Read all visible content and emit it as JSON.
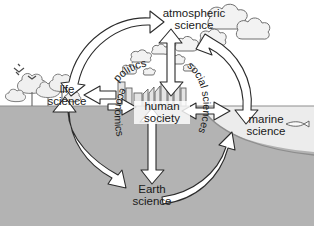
{
  "diagram": {
    "nodes": [
      {
        "id": "atmospheric",
        "label_line1": "atmospheric",
        "label_line2": "science",
        "name": "node-atmospheric-science"
      },
      {
        "id": "life",
        "label_line1": "life",
        "label_line2": "science",
        "name": "node-life-science"
      },
      {
        "id": "human",
        "label_line1": "human",
        "label_line2": "society",
        "name": "node-human-society"
      },
      {
        "id": "marine",
        "label_line1": "marine",
        "label_line2": "science",
        "name": "node-marine-science"
      },
      {
        "id": "earth",
        "label_line1": "Earth",
        "label_line2": "science",
        "name": "node-earth-science"
      }
    ],
    "society_labels": [
      {
        "id": "politics",
        "text": "politics",
        "name": "label-politics"
      },
      {
        "id": "economics",
        "text": "economics",
        "name": "label-economics"
      },
      {
        "id": "social_sciences",
        "text": "social sciences",
        "name": "label-social-sciences"
      }
    ],
    "scene": {
      "sky_label": "sky",
      "ground_label": "ground",
      "ocean_label": "ocean",
      "seabed_label": "seabed",
      "trees_label": "trees",
      "birds_label": "birds",
      "clouds_label": "clouds",
      "city_label": "city-skyline",
      "fish_label": "fish"
    },
    "connections": [
      {
        "from": "life",
        "to": "atmospheric",
        "style": "double",
        "name": "arrow-life-atmospheric"
      },
      {
        "from": "atmospheric",
        "to": "marine",
        "style": "double",
        "name": "arrow-atmospheric-marine"
      },
      {
        "from": "human",
        "to": "atmospheric",
        "style": "double",
        "name": "arrow-human-atmospheric"
      },
      {
        "from": "human",
        "to": "life",
        "style": "double",
        "name": "arrow-human-life"
      },
      {
        "from": "human",
        "to": "marine",
        "style": "double",
        "name": "arrow-human-marine"
      },
      {
        "from": "human",
        "to": "earth",
        "style": "double",
        "name": "arrow-human-earth"
      },
      {
        "from": "life",
        "to": "earth",
        "style": "double",
        "name": "arrow-life-earth"
      },
      {
        "from": "earth",
        "to": "marine",
        "style": "double",
        "name": "arrow-earth-marine"
      }
    ]
  },
  "colors": {
    "ground": "#b3b3b3",
    "ocean": "#e8e8e8",
    "sky": "#ffffff",
    "outline": "#2b2b2b",
    "arrow_fill": "#ffffff",
    "text": "#1a1a1a",
    "border": "#9a9a9a"
  }
}
